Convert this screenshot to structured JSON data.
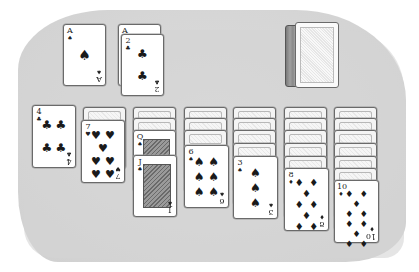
{
  "game": {
    "name": "Solitaire",
    "colors": {
      "table": "#d6d6d6",
      "card_face": "#ffffff",
      "card_border": "#6a6a6a",
      "ink": "#1a1a1a"
    }
  },
  "foundations": [
    {
      "cards": [
        {
          "rank": "A",
          "suit": "♠",
          "suit_name": "spades"
        }
      ]
    },
    {
      "cards": [
        {
          "rank": "A",
          "suit": "♣",
          "suit_name": "clubs"
        },
        {
          "rank": "2",
          "suit": "♣",
          "suit_name": "clubs"
        }
      ]
    }
  ],
  "stock": {
    "face_down": true
  },
  "tableau": [
    {
      "face_down_count": 0,
      "top": {
        "rank": "4",
        "suit": "♣",
        "suit_name": "clubs"
      }
    },
    {
      "face_down_count": 1,
      "top": {
        "rank": "7",
        "suit": "♥",
        "suit_name": "hearts"
      }
    },
    {
      "face_down_count": 2,
      "face_up": [
        {
          "rank": "Q",
          "suit": "♠",
          "suit_name": "spades"
        }
      ],
      "top": {
        "rank": "J",
        "suit": "♠",
        "suit_name": "spades"
      }
    },
    {
      "face_down_count": 3,
      "top": {
        "rank": "6",
        "suit": "♠",
        "suit_name": "spades"
      }
    },
    {
      "face_down_count": 4,
      "top": {
        "rank": "3",
        "suit": "♠",
        "suit_name": "spades"
      }
    },
    {
      "face_down_count": 5,
      "top": {
        "rank": "8",
        "suit": "♦",
        "suit_name": "diamonds"
      }
    },
    {
      "face_down_count": 6,
      "top": {
        "rank": "10",
        "suit": "♦",
        "suit_name": "diamonds"
      }
    }
  ]
}
